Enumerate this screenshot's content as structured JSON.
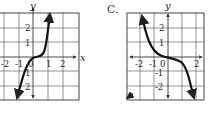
{
  "choices": [
    {
      "letter": "B",
      "visible_label": "",
      "graph": {
        "description": "steep increasing cubic through origin",
        "axis_x_label": "x",
        "axis_y_label": "y",
        "x_ticks": [
          "-2",
          "-1",
          "0",
          "1",
          "2"
        ],
        "y_ticks": [
          "2",
          "1",
          "-1",
          "-2"
        ],
        "curve": "increasing"
      }
    },
    {
      "letter": "C",
      "visible_label": "C.",
      "graph": {
        "description": "decreasing cubic through origin (y = -x^3)",
        "axis_x_label": "",
        "axis_y_label": "y",
        "x_ticks": [
          "-2",
          "-1",
          "0",
          "2"
        ],
        "y_ticks": [
          "2",
          "1",
          "-1",
          "-2"
        ],
        "curve": "decreasing"
      }
    }
  ],
  "colors": {
    "ink": "#222222",
    "grid": "#555555",
    "background": "#ffffff"
  }
}
